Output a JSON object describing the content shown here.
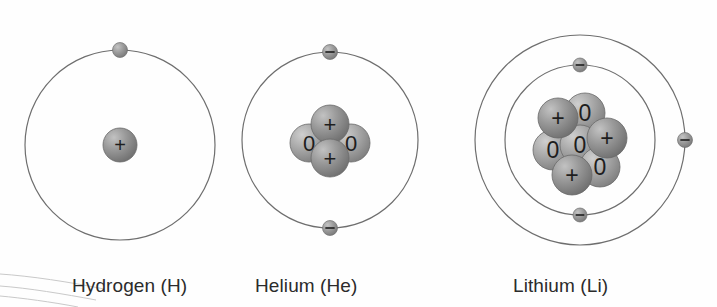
{
  "figure": {
    "background_color": "#fefefe",
    "width": 717,
    "height": 307
  },
  "style": {
    "orbit_stroke": "#6e6e6e",
    "orbit_stroke_width": 1.2,
    "nucleon_fill_light": "#b9b9b9",
    "nucleon_fill_dark": "#7d7d7d",
    "proton_fill": "#8f8f8f",
    "neutron_fill": "#a8a8a8",
    "electron_fill": "#989898",
    "symbol_color": "#1e1e1e",
    "label_color": "#2b2b2b",
    "artifact_color": "#c9c9c9"
  },
  "symbols": {
    "proton": "+",
    "neutron": "0",
    "electron": "–"
  },
  "atoms": [
    {
      "id": "hydrogen",
      "label": "Hydrogen (H)",
      "label_x": 72,
      "label_y": 275,
      "center": {
        "x": 120,
        "y": 145
      },
      "shells": [
        {
          "name": "shell-1",
          "radius": 95
        }
      ],
      "electrons": [
        {
          "name": "electron-1",
          "shell": 0,
          "angle_deg": -90,
          "radius": 95,
          "show_sign": false,
          "size": 15
        }
      ],
      "nucleus": {
        "protons": 1,
        "neutrons": 0,
        "nucleons": [
          {
            "type": "proton",
            "symbol": "+",
            "dx": 0,
            "dy": 0,
            "r": 17,
            "z": 2
          }
        ]
      }
    },
    {
      "id": "helium",
      "label": "Helium (He)",
      "label_x": 255,
      "label_y": 275,
      "center": {
        "x": 330,
        "y": 140
      },
      "shells": [
        {
          "name": "shell-1",
          "radius": 88
        }
      ],
      "electrons": [
        {
          "name": "electron-1",
          "shell": 0,
          "angle_deg": -90,
          "radius": 88,
          "show_sign": true,
          "size": 15
        },
        {
          "name": "electron-2",
          "shell": 0,
          "angle_deg": 90,
          "radius": 88,
          "show_sign": true,
          "size": 15
        }
      ],
      "nucleus": {
        "protons": 2,
        "neutrons": 2,
        "nucleons": [
          {
            "type": "neutron",
            "symbol": "0",
            "dx": -21,
            "dy": 3,
            "r": 19,
            "z": 1
          },
          {
            "type": "neutron",
            "symbol": "0",
            "dx": 21,
            "dy": 3,
            "r": 19,
            "z": 1
          },
          {
            "type": "proton",
            "symbol": "+",
            "dx": 0,
            "dy": -16,
            "r": 19,
            "z": 2
          },
          {
            "type": "proton",
            "symbol": "+",
            "dx": 0,
            "dy": 18,
            "r": 19,
            "z": 2
          }
        ]
      }
    },
    {
      "id": "lithium",
      "label": "Lithium (Li)",
      "label_x": 513,
      "label_y": 275,
      "center": {
        "x": 580,
        "y": 140
      },
      "shells": [
        {
          "name": "shell-1",
          "radius": 75
        },
        {
          "name": "shell-2",
          "radius": 105
        }
      ],
      "electrons": [
        {
          "name": "electron-1",
          "shell": 0,
          "angle_deg": -90,
          "radius": 75,
          "show_sign": true,
          "size": 14
        },
        {
          "name": "electron-2",
          "shell": 0,
          "angle_deg": 90,
          "radius": 75,
          "show_sign": true,
          "size": 14
        },
        {
          "name": "electron-3",
          "shell": 1,
          "angle_deg": 0,
          "radius": 105,
          "show_sign": true,
          "size": 15
        }
      ],
      "nucleus": {
        "protons": 3,
        "neutrons": 4,
        "nucleons": [
          {
            "type": "proton",
            "symbol": "+",
            "dx": -22,
            "dy": -22,
            "r": 20,
            "z": 2
          },
          {
            "type": "neutron",
            "symbol": "0",
            "dx": 5,
            "dy": -27,
            "r": 20,
            "z": 1
          },
          {
            "type": "proton",
            "symbol": "+",
            "dx": 27,
            "dy": -2,
            "r": 20,
            "z": 2
          },
          {
            "type": "neutron",
            "symbol": "0",
            "dx": -27,
            "dy": 10,
            "r": 20,
            "z": 1
          },
          {
            "type": "neutron",
            "symbol": "0",
            "dx": 0,
            "dy": 5,
            "r": 20,
            "z": 1
          },
          {
            "type": "neutron",
            "symbol": "0",
            "dx": 20,
            "dy": 27,
            "r": 20,
            "z": 1
          },
          {
            "type": "proton",
            "symbol": "+",
            "dx": -8,
            "dy": 35,
            "r": 20,
            "z": 2
          }
        ]
      }
    }
  ],
  "artifact": {
    "name": "scan-edge-artifact",
    "visible": true,
    "paths": [
      "M 0 274 C 30 276 70 282 104 289",
      "M 0 286 C 28 288 64 294 96 300",
      "M 0 296 C 22 298 52 302 78 307"
    ]
  }
}
